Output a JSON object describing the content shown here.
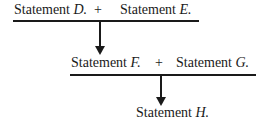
{
  "row1": {
    "left": {
      "prefix": "Statement ",
      "letter": "D."
    },
    "op": "+",
    "right": {
      "prefix": "Statement ",
      "letter": "E."
    }
  },
  "row2": {
    "left": {
      "prefix": "Statement ",
      "letter": "F."
    },
    "op": "+",
    "right": {
      "prefix": "Statement ",
      "letter": "G."
    }
  },
  "result": {
    "prefix": "Statement ",
    "letter": "H."
  }
}
